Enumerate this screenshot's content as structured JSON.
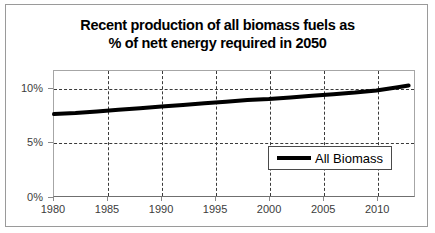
{
  "chart_data": {
    "type": "line",
    "title": "Recent production of all biomass fuels as % of nett energy required in 2050",
    "title_lines": [
      "Recent production of all biomass fuels as",
      "% of nett energy required in 2050"
    ],
    "xlabel": "",
    "ylabel": "",
    "xlim": [
      1980,
      2013.5
    ],
    "ylim": [
      0,
      11.6
    ],
    "ytick_values": [
      0,
      5,
      10
    ],
    "ytick_labels": [
      "0%",
      "5%",
      "10%"
    ],
    "xtick_values": [
      1980,
      1985,
      1990,
      1995,
      2000,
      2005,
      2010
    ],
    "xtick_labels": [
      "1980",
      "1985",
      "1990",
      "1995",
      "2000",
      "2005",
      "2010"
    ],
    "grid": true,
    "grid_style": "dashed",
    "legend_position": "inside-bottom-right",
    "series": [
      {
        "name": "All Biomass",
        "color": "#000000",
        "line_width": 4,
        "x": [
          1980,
          1982,
          1984,
          1986,
          1988,
          1990,
          1992,
          1994,
          1996,
          1998,
          2000,
          2002,
          2004,
          2006,
          2008,
          2010,
          2012,
          2013
        ],
        "values": [
          7.6,
          7.7,
          7.85,
          8.0,
          8.15,
          8.3,
          8.45,
          8.6,
          8.75,
          8.9,
          9.0,
          9.15,
          9.3,
          9.45,
          9.6,
          9.8,
          10.1,
          10.25
        ]
      }
    ]
  },
  "legend": {
    "entries": [
      {
        "label": "All Biomass",
        "color": "#000000"
      }
    ]
  },
  "colors": {
    "series_line": "#000000",
    "grid": "#3a3a3a",
    "axis": "#8a8a8a",
    "tick_text": "#3c3c3c",
    "frame_border": "#9a9a9a",
    "background": "#ffffff"
  }
}
